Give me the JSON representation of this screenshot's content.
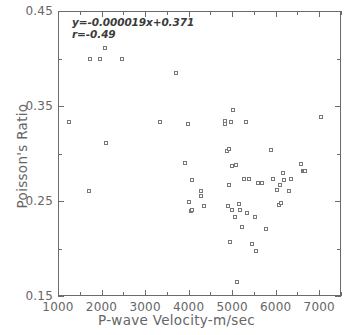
{
  "chart_data": {
    "type": "scatter",
    "title": "",
    "xlabel": "P-wave Velocity-m/sec",
    "ylabel": "Poisson's Ratio",
    "xlim": [
      1000,
      7500
    ],
    "ylim": [
      0.15,
      0.45
    ],
    "xticks": [
      1000,
      2000,
      3000,
      4000,
      5000,
      6000,
      7000
    ],
    "xticklabels": [
      "1000",
      "2000",
      "3000",
      "4000",
      "5000",
      "6000",
      "7000"
    ],
    "yticks": [
      0.15,
      0.25,
      0.35,
      0.45
    ],
    "yticklabels": [
      "0.15",
      "0.25",
      "0.35",
      "0.45"
    ],
    "minor_xticks": [
      1500,
      2500,
      3500,
      4500,
      5500,
      6500,
      7500
    ],
    "minor_yticks": [
      0.2,
      0.3,
      0.4
    ],
    "grid": false,
    "legend": null,
    "marker": "open-square",
    "annotations": [
      {
        "text": "y=-0.000019x+0.371",
        "x": 1450,
        "y": 0.433
      },
      {
        "text": "r=-0.49",
        "x": 1450,
        "y": 0.421
      }
    ],
    "fit": {
      "slope": -1.9e-05,
      "intercept": 0.371,
      "r": -0.49,
      "equation": "y=-0.000019x+0.371",
      "correlation_label": "r=-0.49",
      "drawn": false
    },
    "x": [
      1270,
      1740,
      1750,
      1980,
      2110,
      2120,
      2500,
      3370,
      3730,
      3950,
      4010,
      4030,
      4070,
      4090,
      4110,
      4300,
      4310,
      4370,
      4850,
      4870,
      4900,
      4930,
      4950,
      4960,
      4970,
      4990,
      5010,
      5030,
      5050,
      5090,
      5100,
      5130,
      5170,
      5200,
      5240,
      5290,
      5340,
      5360,
      5400,
      5490,
      5540,
      5570,
      5620,
      5700,
      5810,
      5920,
      5960,
      6050,
      6110,
      6130,
      6150,
      6180,
      6220,
      6340,
      6370,
      6600,
      6640,
      6670,
      6700,
      7060
    ],
    "y": [
      0.332,
      0.259,
      0.398,
      0.398,
      0.41,
      0.31,
      0.398,
      0.332,
      0.384,
      0.289,
      0.33,
      0.248,
      0.238,
      0.271,
      0.24,
      0.259,
      0.254,
      0.244,
      0.33,
      0.333,
      0.302,
      0.244,
      0.304,
      0.266,
      0.206,
      0.332,
      0.24,
      0.286,
      0.345,
      0.232,
      0.287,
      0.164,
      0.246,
      0.24,
      0.222,
      0.272,
      0.332,
      0.236,
      0.272,
      0.204,
      0.232,
      0.196,
      0.268,
      0.268,
      0.219,
      0.303,
      0.272,
      0.261,
      0.245,
      0.266,
      0.247,
      0.278,
      0.271,
      0.259,
      0.272,
      0.288,
      0.281,
      0.281,
      0.281,
      0.337
    ]
  },
  "colors": {
    "axis": "#6b6b6b",
    "text": "#666666",
    "annotation": "#3a3a3a",
    "marker_edge": "#777777",
    "marker_face": "#ffffff",
    "background": "#ffffff"
  }
}
